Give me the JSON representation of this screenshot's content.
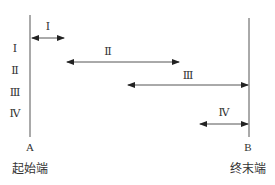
{
  "diagram": {
    "start_point": {
      "letter": "A",
      "caption": "起始端"
    },
    "end_point": {
      "letter": "B",
      "caption": "终末端"
    },
    "row_labels": [
      "Ⅰ",
      "Ⅱ",
      "Ⅲ",
      "Ⅳ"
    ],
    "segments": [
      {
        "label": "Ⅰ"
      },
      {
        "label": "Ⅱ"
      },
      {
        "label": "Ⅲ"
      },
      {
        "label": "Ⅳ"
      }
    ],
    "line_color": "#555555"
  }
}
